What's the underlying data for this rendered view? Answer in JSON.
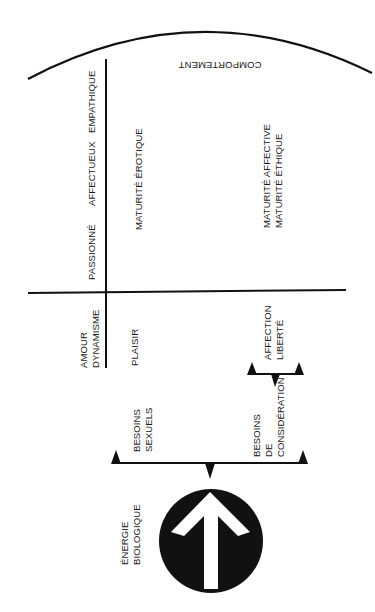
{
  "diagram": {
    "orientation": "rotated-90-ccw",
    "colors": {
      "ink": "#111111",
      "background": "#ffffff",
      "arrow": "#ffffff"
    },
    "arc_label": "COMPORTEMENT",
    "source": {
      "label_line1": "ÉNERGIE",
      "label_line2": "BIOLOGIQUE",
      "icon": "up-arrow-in-circle"
    },
    "needs": [
      {
        "line1": "BESOINS",
        "line2": "SEXUELS"
      },
      {
        "line1": "BESOINS",
        "line2": "DE",
        "line3": "CONSIDÉRATION"
      }
    ],
    "row_header": {
      "line1": "AMOUR",
      "line2": "DYNAMISME"
    },
    "column_headers": [
      "PASSIONNÉ",
      "AFFECTUEUX",
      "EMPATHIQUE"
    ],
    "outcomes": {
      "plaisir": "PLAISIR",
      "affection_liberte": {
        "line1": "AFFECTION",
        "line2": "LIBERTÉ"
      }
    },
    "maturity": {
      "erotique": "MATURITÉ ÉROTIQUE",
      "affective": "MATURITÉ AFFECTIVE",
      "ethique": "MATURITÉ ÉTHIQUE"
    }
  }
}
